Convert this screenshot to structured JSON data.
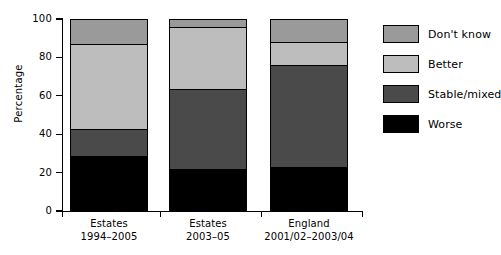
{
  "chart_data": {
    "type": "bar",
    "subtype": "stacked-bar",
    "title": "",
    "xlabel": "",
    "ylabel": "Percentage",
    "ylim": [
      0,
      100
    ],
    "yticks": [
      0,
      20,
      40,
      60,
      80,
      100
    ],
    "ytick_labels": [
      "0",
      "20",
      "40",
      "60",
      "80",
      "100"
    ],
    "grid": false,
    "legend_position": "right",
    "categories": [
      "Estates 1994–2005",
      "Estates 2003–05",
      "England 2001/02–2003/04"
    ],
    "category_lines": [
      {
        "line1": "Estates",
        "line2": "1994–2005"
      },
      {
        "line1": "Estates",
        "line2": "2003–05"
      },
      {
        "line1": "England",
        "line2": "2001/02–2003/04"
      }
    ],
    "stack_order_bottom_to_top": [
      "Worse",
      "Stable/mixed",
      "Better",
      "Don't know"
    ],
    "series": [
      {
        "name": "Worse",
        "color": "#000000",
        "values": [
          28,
          21,
          22
        ]
      },
      {
        "name": "Stable/mixed",
        "color": "#4a4a4a",
        "values": [
          14,
          42,
          54
        ]
      },
      {
        "name": "Better",
        "color": "#bdbdbd",
        "values": [
          45,
          33,
          12
        ]
      },
      {
        "name": "Don't know",
        "color": "#9a9a9a",
        "values": [
          13,
          4,
          12
        ]
      }
    ],
    "cumulative_tops": [
      [
        28,
        42,
        87,
        100
      ],
      [
        21,
        63,
        96,
        100
      ],
      [
        22,
        76,
        88,
        100
      ]
    ]
  },
  "legend": {
    "entries": [
      {
        "label": "Don't know",
        "color": "#9a9a9a"
      },
      {
        "label": "Better",
        "color": "#bdbdbd"
      },
      {
        "label": "Stable/mixed",
        "color": "#4a4a4a"
      },
      {
        "label": "Worse",
        "color": "#000000"
      }
    ]
  }
}
